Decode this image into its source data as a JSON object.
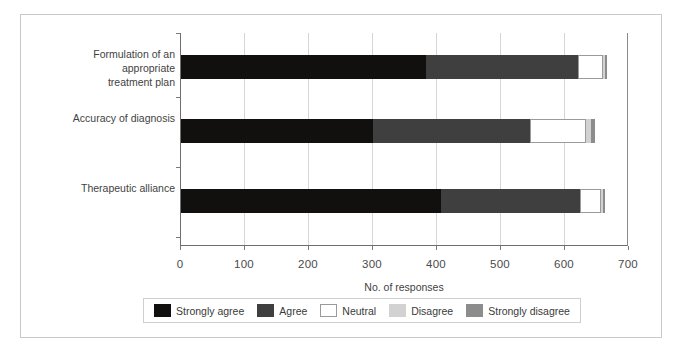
{
  "chart_data": {
    "type": "bar",
    "orientation": "horizontal",
    "stacked": true,
    "title": "",
    "xlabel": "No. of responses",
    "ylabel": "",
    "xlim": [
      0,
      700
    ],
    "xticks": [
      0,
      100,
      200,
      300,
      400,
      500,
      600,
      700
    ],
    "xticklabels": [
      "0",
      "100",
      "200",
      "300",
      "400",
      "500",
      "600",
      "700"
    ],
    "grid": "vertical",
    "legend_position": "bottom",
    "categories": [
      "Formulation of an appropriate\ntreatment plan",
      "Accuracy of diagnosis",
      "Therapeutic alliance"
    ],
    "series": [
      {
        "name": "Strongly agree",
        "color": "#120f0f",
        "values": [
          383,
          300,
          406
        ]
      },
      {
        "name": "Agree",
        "color": "#3f3f3f",
        "values": [
          238,
          245,
          217
        ]
      },
      {
        "name": "Neutral",
        "color": "#ffffff",
        "values": [
          39,
          88,
          33
        ]
      },
      {
        "name": "Disagree",
        "color": "#d2d2d2",
        "values": [
          3,
          8,
          3
        ]
      },
      {
        "name": "Strongly disagree",
        "color": "#8c8c8c",
        "values": [
          3,
          6,
          4
        ]
      }
    ]
  },
  "legend": {
    "items": [
      {
        "label": "Strongly agree",
        "color": "#120f0f"
      },
      {
        "label": "Agree",
        "color": "#3f3f3f"
      },
      {
        "label": "Neutral",
        "color": "#ffffff"
      },
      {
        "label": "Disagree",
        "color": "#d2d2d2"
      },
      {
        "label": "Strongly disagree",
        "color": "#8c8c8c"
      }
    ]
  }
}
